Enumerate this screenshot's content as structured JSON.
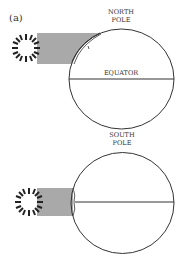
{
  "figure": {
    "panel_label": "(a)",
    "top_diagram": {
      "north_label_line1": "NORTH",
      "north_label_line2": "POLE",
      "equator_label": "EQUATOR"
    },
    "bottom_diagram": {
      "south_label_line1": "SOUTH",
      "south_label_line2": "POLE"
    },
    "colors": {
      "beam": "#a9a9a9",
      "stroke": "#333333"
    }
  }
}
